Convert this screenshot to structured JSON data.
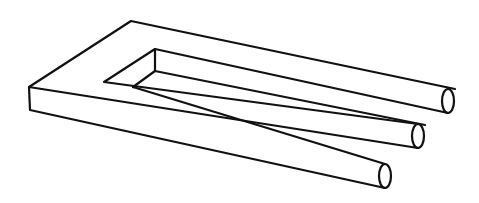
{
  "figure": {
    "colors": {
      "line": "#111111",
      "background": "#ffffff"
    },
    "prong_count": 3
  }
}
